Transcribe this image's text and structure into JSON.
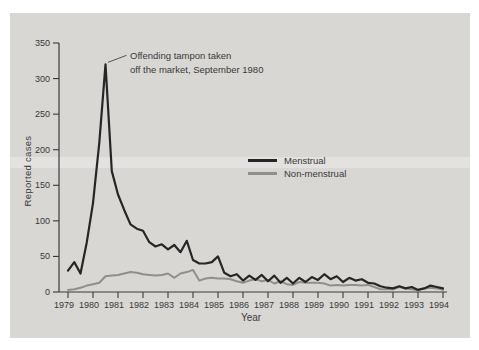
{
  "figure": {
    "page_background": "#ffffff",
    "panel_background": "#d8d7d4",
    "axis_color": "#3a3a3a"
  },
  "chart_data": {
    "type": "line",
    "title": "",
    "xlabel": "Year",
    "ylabel": "Reported cases",
    "xlim": [
      1979,
      1994
    ],
    "ylim": [
      0,
      350
    ],
    "yticks": [
      0,
      50,
      100,
      150,
      200,
      250,
      300,
      350
    ],
    "xticks": [
      1979,
      1980,
      1981,
      1982,
      1983,
      1984,
      1985,
      1986,
      1987,
      1988,
      1989,
      1990,
      1991,
      1992,
      1993,
      1994
    ],
    "grid": false,
    "legend_position": "center-right",
    "x_start": 1979.0,
    "x_step": 0.25,
    "x_unit": "quarterly",
    "series": [
      {
        "name": "Non-menstrual",
        "color": "#8f8f8c",
        "stroke_width": 2,
        "values": [
          3,
          4,
          6,
          9,
          11,
          13,
          22,
          23,
          24,
          26,
          28,
          27,
          25,
          24,
          23,
          24,
          26,
          20,
          26,
          28,
          31,
          16,
          19,
          20,
          19,
          19,
          18,
          15,
          13,
          16,
          18,
          15,
          17,
          12,
          15,
          11,
          10,
          14,
          13,
          13,
          13,
          12,
          9,
          10,
          9,
          10,
          10,
          9,
          10,
          7,
          4,
          4,
          4,
          7,
          5,
          4,
          3,
          5,
          6,
          5,
          3
        ]
      },
      {
        "name": "Menstrual",
        "color": "#262626",
        "stroke_width": 2.2,
        "values": [
          30,
          42,
          26,
          70,
          125,
          210,
          320,
          170,
          137,
          115,
          95,
          89,
          86,
          70,
          64,
          67,
          60,
          66,
          56,
          72,
          45,
          40,
          40,
          42,
          50,
          27,
          22,
          25,
          16,
          23,
          17,
          24,
          15,
          23,
          13,
          20,
          12,
          20,
          14,
          21,
          17,
          25,
          18,
          22,
          14,
          20,
          16,
          18,
          13,
          12,
          8,
          6,
          5,
          8,
          5,
          7,
          3,
          5,
          9,
          7,
          5
        ]
      }
    ],
    "legend": [
      "Menstrual",
      "Non-menstrual"
    ],
    "annotation_lines": [
      "Offending tampon taken",
      "off the market, September 1980"
    ],
    "annotation_points_to": {
      "x": 1980.5,
      "y": 320
    }
  }
}
